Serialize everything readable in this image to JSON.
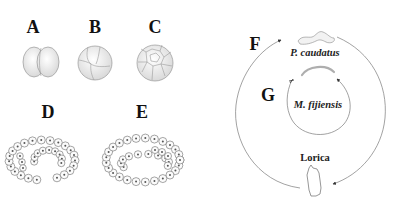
{
  "panels": {
    "A": {
      "label": "A",
      "stage": "2-cell embryo"
    },
    "B": {
      "label": "B",
      "stage": "4-cell embryo"
    },
    "C": {
      "label": "C",
      "stage": "multicellular embryo"
    },
    "D": {
      "label": "D",
      "stage": "folding embryo"
    },
    "E": {
      "label": "E",
      "stage": "folded embryo"
    },
    "F": {
      "label": "F",
      "cycle": "outer life cycle"
    },
    "G": {
      "label": "G",
      "cycle": "inner life cycle"
    }
  },
  "cycle_labels": {
    "outer_species": "P. caudatus",
    "inner_species": "M. fijiensis",
    "lorica": "Lorica"
  },
  "colors": {
    "ink": "#111111",
    "line": "#7a7a7a",
    "background": "#ffffff"
  }
}
